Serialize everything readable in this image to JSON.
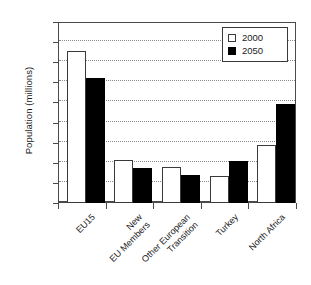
{
  "chart_data": {
    "type": "bar",
    "title": "",
    "xlabel": "",
    "ylabel": "Population (millions)",
    "ylim": [
      0,
      450
    ],
    "ytick_step": 50,
    "yticks": [
      0,
      50,
      100,
      150,
      200,
      250,
      300,
      350,
      400,
      450
    ],
    "ytick_labels": [
      "0",
      "50",
      "100",
      "150",
      "200",
      "250",
      "300",
      "350",
      "400",
      "450"
    ],
    "grid": true,
    "grid_axis": "y",
    "grid_style": "dotted",
    "legend_position": "top-right",
    "categories": [
      "EU15",
      "New\nEU Members",
      "Other European\nTransition",
      "Turkey",
      "North Africa"
    ],
    "series": [
      {
        "name": "2000",
        "color": "#ffffff",
        "edgecolor": "#3a3a3a",
        "values": [
          377,
          106,
          89,
          68,
          144
        ]
      },
      {
        "name": "2050",
        "color": "#000000",
        "edgecolor": "#000000",
        "values": [
          312,
          88,
          70,
          104,
          247
        ]
      }
    ]
  },
  "legend": {
    "items": [
      {
        "label": "2000"
      },
      {
        "label": "2050"
      }
    ]
  },
  "axes": {
    "y_title": "Population (millions)"
  }
}
